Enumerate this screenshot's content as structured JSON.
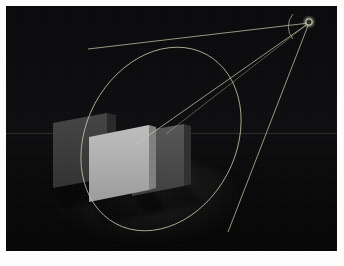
{
  "app": {
    "title": "3D Viewport — Spotlight Cone",
    "render_mode": "Shaded / Solid",
    "background_color": "#050507"
  },
  "viewport": {
    "name": "perspective-viewport",
    "width": 331,
    "height": 245,
    "border_color": "#fdfdfd",
    "horizon_y": 127
  },
  "gizmo": {
    "label": "Spotlight Cone",
    "wire_color": "#c6c6a8",
    "wire_color_dim": "#8d8d78",
    "apex": {
      "x": 303,
      "y": 16,
      "radius": 3.2,
      "label": "light-origin-handle"
    },
    "cone_rays": [
      {
        "name": "ray-upper-left",
        "x1": 303,
        "y1": 16,
        "x2": 82,
        "y2": 42
      },
      {
        "name": "ray-lower-left",
        "x1": 303,
        "y1": 16,
        "x2": 131,
        "y2": 138
      },
      {
        "name": "ray-lower-right",
        "x1": 303,
        "y1": 16,
        "x2": 219,
        "y2": 224
      },
      {
        "name": "ray-center-axis",
        "x1": 303,
        "y1": 16,
        "x2": 151,
        "y2": 127
      }
    ],
    "base_ellipse": {
      "name": "cone-base-ellipse",
      "cx": 155,
      "cy": 133,
      "rx": 75,
      "ry": 96,
      "rotation_deg": 28
    },
    "aperture_arc": {
      "name": "cone-angle-arc",
      "cx": 303,
      "cy": 16,
      "radius": 19,
      "start_deg": 172,
      "end_deg": 234
    }
  },
  "scene_objects": [
    {
      "name": "panel-back-left",
      "label": "Panel A (shadowed)",
      "fill": "#3a3a3a",
      "side_fill": "#232323",
      "points": "48,118 100,109 100,173 48,182",
      "side_points": "100,109 111,111 111,171 100,173"
    },
    {
      "name": "panel-center-lit",
      "label": "Panel B (fully lit)",
      "fill": "#b2b2b2",
      "side_fill": "#7d7d7d",
      "points": "84,132 142,120 142,185 84,196"
    },
    {
      "name": "panel-right",
      "label": "Panel C (half lit)",
      "fill": "#4c4c4c",
      "side_fill": "#2c2c2c",
      "points": "127,128 177,120 177,181 127,190"
    }
  ],
  "shadows": [
    {
      "name": "shadow-panel-a",
      "points": "48,182 100,173 112,188 56,199",
      "fill": "rgba(0,0,0,0.55)"
    },
    {
      "name": "shadow-panel-b",
      "points": "84,196 142,185 155,200 96,213",
      "fill": "rgba(0,0,0,0.5)"
    }
  ],
  "overlay": {
    "status": "",
    "coordinates": ""
  }
}
